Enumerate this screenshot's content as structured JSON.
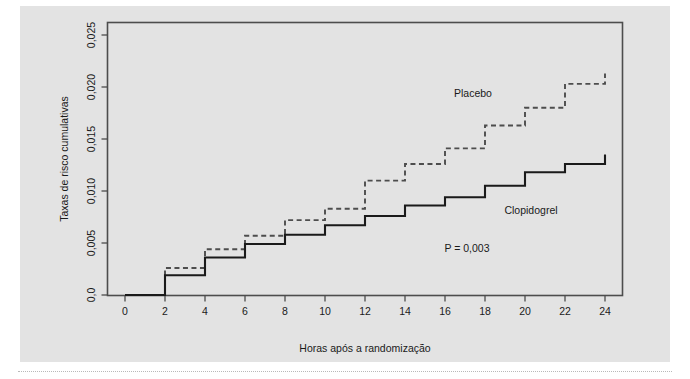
{
  "figure": {
    "background_color": "#e3e3e3",
    "page_color": "#ffffff",
    "plot_border_color": "#4d4d4d"
  },
  "chart_data": {
    "type": "line",
    "title": "",
    "subtitle": "",
    "xlabel": "Horas após a randomização",
    "ylabel": "Taxas de risco cumulativas",
    "xlim": [
      0,
      25
    ],
    "ylim": [
      0.0,
      0.0265
    ],
    "grid": false,
    "legend_position": "inline-annotations",
    "xticks": [
      0,
      2,
      4,
      6,
      8,
      10,
      12,
      14,
      16,
      18,
      20,
      22,
      24
    ],
    "xticklabels": [
      "0",
      "2",
      "4",
      "6",
      "8",
      "10",
      "12",
      "14",
      "16",
      "18",
      "20",
      "22",
      "24"
    ],
    "yticks": [
      0.0,
      0.005,
      0.01,
      0.015,
      0.02,
      0.025
    ],
    "yticklabels": [
      "0,0",
      "0,005",
      "0,010",
      "0,015",
      "0,020",
      "0,025"
    ],
    "series": [
      {
        "name": "Placebo",
        "style": "dashed",
        "color": "#4d4d4d",
        "label_x": 13.0,
        "label_y": 0.0205,
        "x": [
          0,
          2,
          2,
          4,
          4,
          6,
          6,
          8,
          8,
          10,
          10,
          12,
          12,
          14,
          14,
          16,
          16,
          18,
          18,
          20,
          20,
          22,
          22,
          24,
          24
        ],
        "y": [
          0.0,
          0.0,
          0.0026,
          0.0026,
          0.0044,
          0.0044,
          0.0057,
          0.0057,
          0.0072,
          0.0072,
          0.0083,
          0.0083,
          0.011,
          0.011,
          0.0126,
          0.0126,
          0.0141,
          0.0141,
          0.0163,
          0.0163,
          0.018,
          0.018,
          0.0203,
          0.0203,
          0.0213
        ]
      },
      {
        "name": "Clopidogrel",
        "style": "solid",
        "color": "#1a1a1a",
        "label_x": 17.6,
        "label_y": 0.0089,
        "x": [
          0,
          2,
          2,
          4,
          4,
          6,
          6,
          8,
          8,
          10,
          10,
          12,
          12,
          14,
          14,
          16,
          16,
          18,
          18,
          20,
          20,
          22,
          22,
          24,
          24
        ],
        "y": [
          0.0,
          0.0,
          0.0019,
          0.0019,
          0.0036,
          0.0036,
          0.0049,
          0.0049,
          0.0058,
          0.0058,
          0.0067,
          0.0067,
          0.0076,
          0.0076,
          0.0086,
          0.0086,
          0.0094,
          0.0094,
          0.0105,
          0.0105,
          0.0118,
          0.0118,
          0.0126,
          0.0126,
          0.0135
        ]
      }
    ],
    "annotations": [
      {
        "name": "placebo-series-label",
        "text": "Placebo"
      },
      {
        "name": "clopidogrel-series-label",
        "text": "Clopidogrel"
      },
      {
        "name": "p-value-label",
        "text": "P = 0,003"
      }
    ]
  }
}
